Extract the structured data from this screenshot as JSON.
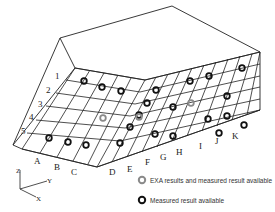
{
  "diagram": {
    "row_labels": [
      "1",
      "2",
      "3",
      "4",
      "5"
    ],
    "column_labels": [
      "A",
      "B",
      "C",
      "D",
      "E",
      "F",
      "G",
      "H",
      "I",
      "J",
      "K"
    ],
    "axis_labels": {
      "z": "Z",
      "y": "Y",
      "x": "X"
    },
    "legend": [
      {
        "symbol": "gray-ring",
        "label": "EXA results and measured result available",
        "color": "#8a8a8a"
      },
      {
        "symbol": "black-ring",
        "label": "Measured result available",
        "color": "#111111"
      }
    ],
    "points": {
      "measured": [
        [
          84,
          81
        ],
        [
          102,
          87
        ],
        [
          121,
          91
        ],
        [
          156,
          90
        ],
        [
          190,
          81
        ],
        [
          209,
          76
        ],
        [
          242,
          68
        ],
        [
          227,
          96
        ],
        [
          147,
          103
        ],
        [
          173,
          107
        ],
        [
          227,
          116
        ],
        [
          244,
          125
        ],
        [
          208,
          119
        ],
        [
          139,
          115
        ],
        [
          219,
          133
        ],
        [
          130,
          127
        ],
        [
          173,
          136
        ],
        [
          155,
          134
        ],
        [
          49,
          138
        ],
        [
          68,
          142
        ],
        [
          86,
          145
        ],
        [
          120,
          143
        ]
      ],
      "exa": [
        [
          103,
          118
        ],
        [
          139,
          117
        ],
        [
          191,
          103
        ]
      ]
    }
  }
}
